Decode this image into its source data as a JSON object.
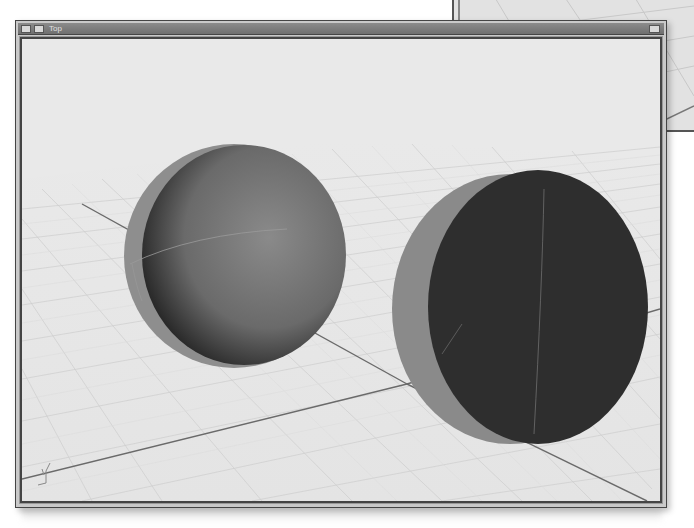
{
  "background_window": {
    "description": "partially visible viewport window behind main window"
  },
  "main_window": {
    "title": "Top",
    "icons": [
      "viewport-menu-icon",
      "viewport-options-icon"
    ],
    "maximize_icon": "maximize-icon"
  },
  "viewport": {
    "background_color": "#e9e9e9",
    "grid_color": "#c4c4c4",
    "axis_line_color": "#6a6a6a",
    "objects": [
      {
        "name": "hemisphere",
        "shading": "gradient",
        "face_color": "#5a5a5a",
        "rim_color": "#8e8e8e"
      },
      {
        "name": "disk",
        "shading": "flat",
        "face_color": "#2e2e2e",
        "rim_color": "#8a8a8a"
      }
    ],
    "axis_widget": "world-axes-icon"
  },
  "colors": {
    "titlebar": "#7b7b7b",
    "frame": "#444444"
  }
}
